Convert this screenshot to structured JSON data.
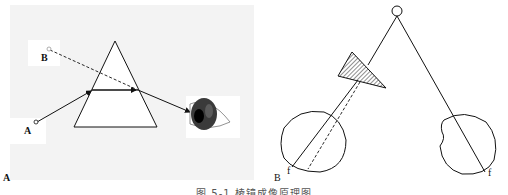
{
  "figure": {
    "caption": "图 5-1  棱镜成像原理图",
    "panel_a": {
      "panel_label": "A",
      "point_a_label": "A",
      "point_b_label": "B",
      "elements": [
        "prism",
        "solid refracted ray from A",
        "dashed apparent ray toward B",
        "eye"
      ]
    },
    "panel_b": {
      "panel_label": "B",
      "left_fovea_label": "f",
      "right_fovea_label": "f",
      "elements": [
        "fixation target circle",
        "hatched prism before left eye",
        "left eye",
        "right eye",
        "dashed deviated ray"
      ]
    }
  },
  "colors": {
    "background_a": "#f3f3f3",
    "line": "#111111",
    "hatch": "#222222"
  }
}
